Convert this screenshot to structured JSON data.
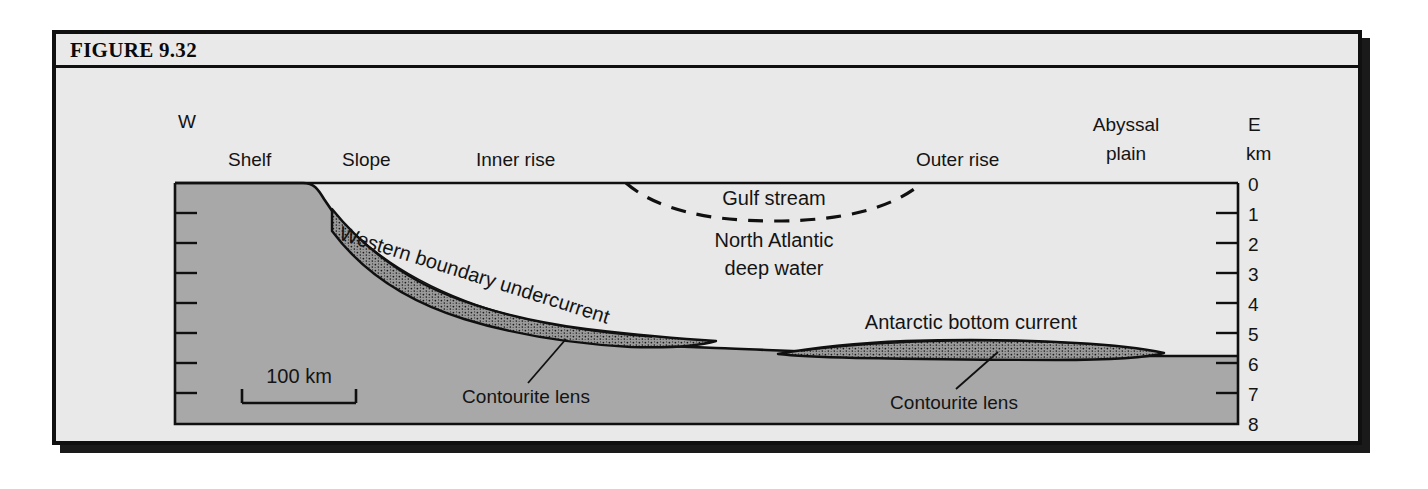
{
  "figure": {
    "title": "FIGURE 9.32"
  },
  "diagram": {
    "compass": {
      "west": "W",
      "east": "E",
      "depth_unit": "km"
    },
    "regions": [
      {
        "name": "shelf",
        "label": "Shelf"
      },
      {
        "name": "slope",
        "label": "Slope"
      },
      {
        "name": "inner-rise",
        "label": "Inner rise"
      },
      {
        "name": "outer-rise",
        "label": "Outer rise"
      },
      {
        "name": "abyssal-plain-line1",
        "label": "Abyssal"
      },
      {
        "name": "abyssal-plain-line2",
        "label": "plain"
      }
    ],
    "water_masses": [
      {
        "name": "gulf-stream",
        "label": "Gulf stream"
      },
      {
        "name": "north-atlantic-deep-water-line1",
        "label": "North Atlantic"
      },
      {
        "name": "north-atlantic-deep-water-line2",
        "label": "deep water"
      }
    ],
    "currents": [
      {
        "name": "western-boundary-undercurrent",
        "label": "Western boundary undercurrent"
      },
      {
        "name": "antarctic-bottom-current",
        "label": "Antarctic bottom current"
      }
    ],
    "deposits": [
      {
        "name": "contourite-lens-west",
        "label": "Contourite lens"
      },
      {
        "name": "contourite-lens-east",
        "label": "Contourite lens"
      }
    ],
    "scale_bar": {
      "label": "100 km"
    },
    "depth_axis": {
      "unit": "km",
      "ticks": [
        "0",
        "1",
        "2",
        "3",
        "4",
        "5",
        "6",
        "7",
        "8"
      ],
      "min": 0,
      "max": 8
    },
    "colors": {
      "panel_background": "#e9e9e9",
      "water": "#e8e8e8",
      "seafloor": "#a8a8a8",
      "lens_fill": "#9a9a9a",
      "line": "#101010"
    }
  }
}
